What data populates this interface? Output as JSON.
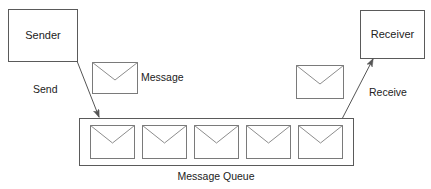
{
  "diagram": {
    "title": "Message Queue",
    "canvas": {
      "width": 431,
      "height": 189,
      "background": "#ffffff"
    },
    "colors": {
      "box_stroke": "#5a5a5a",
      "envelope_stroke": "#7a7a7a",
      "envelope_flap_stroke": "#8d8d8d",
      "arrow_stroke": "#555555",
      "text": "#222222",
      "fill": "#ffffff"
    },
    "nodes": {
      "sender": {
        "label": "Sender",
        "x": 8,
        "y": 9,
        "width": 69,
        "height": 52
      },
      "receiver": {
        "label": "Receiver",
        "x": 360,
        "y": 10,
        "width": 64,
        "height": 48
      }
    },
    "queue": {
      "caption": "Message Queue",
      "x": 79,
      "y": 118,
      "width": 274,
      "height": 47,
      "caption_x": 216,
      "caption_y": 177,
      "item_count": 5,
      "items": [
        {
          "index": 1,
          "x": 90,
          "y": 125,
          "width": 44,
          "height": 33
        },
        {
          "index": 2,
          "x": 142,
          "y": 125,
          "width": 44,
          "height": 33
        },
        {
          "index": 3,
          "x": 194,
          "y": 125,
          "width": 44,
          "height": 33
        },
        {
          "index": 4,
          "x": 246,
          "y": 125,
          "width": 44,
          "height": 33
        },
        {
          "index": 5,
          "x": 298,
          "y": 125,
          "width": 44,
          "height": 33
        }
      ]
    },
    "floating_envelopes": [
      {
        "name": "message-envelope-left",
        "x": 92,
        "y": 62,
        "width": 45,
        "height": 31,
        "label": "Message",
        "label_x": 141,
        "label_y": 78
      },
      {
        "name": "message-envelope-right",
        "x": 296,
        "y": 65,
        "width": 47,
        "height": 33,
        "label": "",
        "label_x": 0,
        "label_y": 0
      }
    ],
    "edges": [
      {
        "name": "send-edge",
        "label": "Send",
        "from": "sender",
        "to": "message-queue",
        "x1": 77,
        "y1": 61,
        "x2": 99,
        "y2": 117,
        "label_x": 33,
        "label_y": 90
      },
      {
        "name": "receive-edge",
        "label": "Receive",
        "from": "message-queue",
        "to": "receiver",
        "x1": 342,
        "y1": 119,
        "x2": 373,
        "y2": 59,
        "label_x": 369,
        "label_y": 93
      }
    ]
  }
}
